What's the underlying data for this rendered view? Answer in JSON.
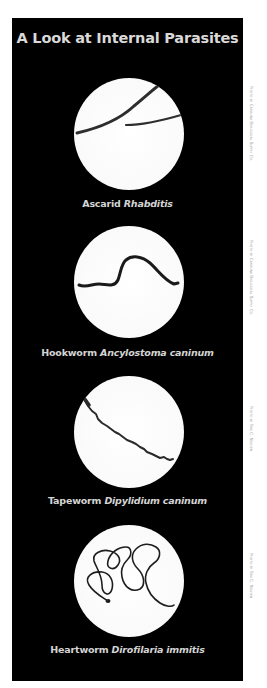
{
  "title": "A Look at Internal Parasites",
  "colors": {
    "background": "#ffffff",
    "panel": "#000000",
    "text": "#d9d9d9",
    "circle": "#ffffff",
    "worm": "#2a2a2a",
    "credit": "#9a9a9a"
  },
  "parasites": [
    {
      "common_name": "Ascarid",
      "scientific_name": "Rhabditis",
      "credit": "Photo by Carolina Biological Supply Co."
    },
    {
      "common_name": "Hookworm",
      "scientific_name": "Ancylostoma caninum",
      "credit": "Photo by Carolina Biological Supply Co."
    },
    {
      "common_name": "Tapeworm",
      "scientific_name": "Dipylidium caninum",
      "credit": "Photo by Tan C. Nguyen"
    },
    {
      "common_name": "Heartworm",
      "scientific_name": "Dirofilaria immitis",
      "credit": "Photo by Tan C. Nguyen"
    }
  ]
}
